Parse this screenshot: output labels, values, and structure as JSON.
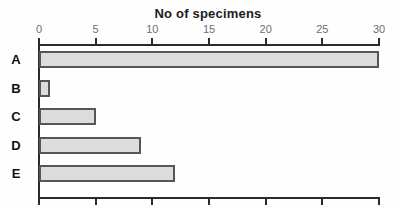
{
  "chart_data": {
    "type": "bar",
    "orientation": "horizontal",
    "title": "No of specimens",
    "categories": [
      "A",
      "B",
      "C",
      "D",
      "E"
    ],
    "values": [
      30,
      1,
      5,
      9,
      12
    ],
    "xlabel": "",
    "ylabel": "",
    "xlim": [
      0,
      30
    ],
    "xticks": [
      0,
      5,
      10,
      15,
      20,
      25,
      30
    ],
    "xtick_labels": [
      "0",
      "5",
      "10",
      "15",
      "20",
      "25",
      "30"
    ],
    "axis_labels_position": "top",
    "bottom_axis_ticks_labeled": false,
    "grid": false,
    "legend": "none",
    "colors": {
      "bar_fill": "#dcdcdc",
      "bar_border": "#565656",
      "axis": "#2b2b2b",
      "tick_label": "#6f6f6f",
      "category_label": "#111111",
      "title": "#1c1c1c",
      "background": "#fefefe"
    }
  }
}
